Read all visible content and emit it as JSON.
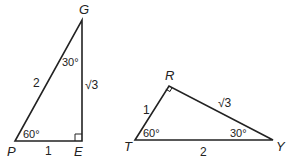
{
  "triangles": [
    {
      "name": "PEG",
      "vertices": {
        "P": "P",
        "E": "E",
        "G": "G"
      },
      "sides": {
        "PE": "1",
        "PG": "2",
        "EG": "√3"
      },
      "angles": {
        "P": "60°",
        "G": "30°",
        "E_right_angle": true
      }
    },
    {
      "name": "TRY",
      "vertices": {
        "T": "T",
        "R": "R",
        "Y": "Y"
      },
      "sides": {
        "TR": "1",
        "RY": "√3",
        "TY": "2"
      },
      "angles": {
        "T": "60°",
        "Y": "30°",
        "R_right_angle": true
      }
    }
  ],
  "colors": {
    "stroke": "#222222",
    "background": "#ffffff"
  }
}
